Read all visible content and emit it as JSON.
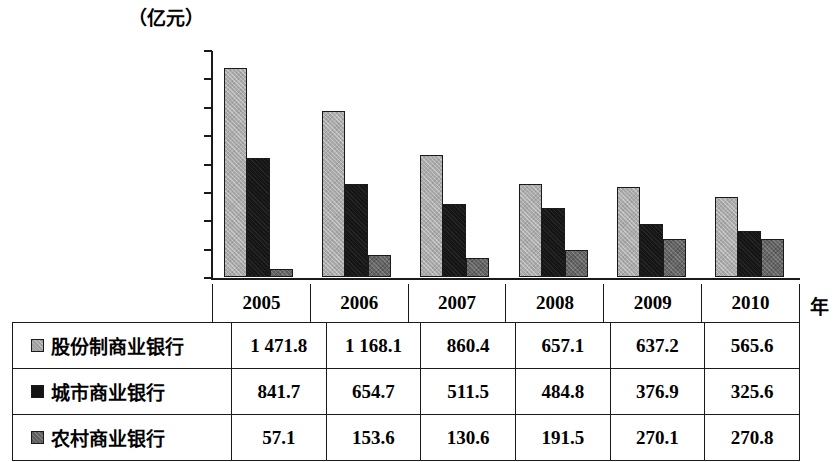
{
  "chart_data": {
    "type": "bar",
    "title": "",
    "unit_label": "（亿元）",
    "xlabel": "年",
    "ylabel": "",
    "categories": [
      "2005",
      "2006",
      "2007",
      "2008",
      "2009",
      "2010"
    ],
    "ylim": [
      0,
      1600
    ],
    "ytick_labels": [
      "1 600",
      "1 400",
      "1 200",
      "1 000",
      "800",
      "600",
      "400",
      "200",
      "0"
    ],
    "ytick_values": [
      1600,
      1400,
      1200,
      1000,
      800,
      600,
      400,
      200,
      0
    ],
    "grid": false,
    "legend_position": "table-row-labels",
    "series": [
      {
        "name": "股份制商业银行",
        "color": "#ababab",
        "values": [
          1471.8,
          1168.1,
          860.4,
          657.1,
          637.2,
          565.6
        ],
        "display_values": [
          "1 471.8",
          "1 168.1",
          "860.4",
          "657.1",
          "637.2",
          "565.6"
        ]
      },
      {
        "name": "城市商业银行",
        "color": "#151515",
        "values": [
          841.7,
          654.7,
          511.5,
          484.8,
          376.9,
          325.6
        ],
        "display_values": [
          "841.7",
          "654.7",
          "511.5",
          "484.8",
          "376.9",
          "325.6"
        ]
      },
      {
        "name": "农村商业银行",
        "color": "#656565",
        "values": [
          57.1,
          153.6,
          130.6,
          191.5,
          270.1,
          270.8
        ],
        "display_values": [
          "57.1",
          "153.6",
          "130.6",
          "191.5",
          "270.1",
          "270.8"
        ]
      }
    ]
  },
  "table": {
    "column_headers": [
      "2005",
      "2006",
      "2007",
      "2008",
      "2009",
      "2010"
    ],
    "rows": [
      {
        "label": "股份制商业银行",
        "swatch": "light-gray-square",
        "cells": [
          "1 471.8",
          "1 168.1",
          "860.4",
          "657.1",
          "637.2",
          "565.6"
        ]
      },
      {
        "label": "城市商业银行",
        "swatch": "black-square",
        "cells": [
          "841.7",
          "654.7",
          "511.5",
          "484.8",
          "376.9",
          "325.6"
        ]
      },
      {
        "label": "农村商业银行",
        "swatch": "dark-gray-square",
        "cells": [
          "57.1",
          "153.6",
          "130.6",
          "191.5",
          "270.1",
          "270.8"
        ]
      }
    ]
  }
}
